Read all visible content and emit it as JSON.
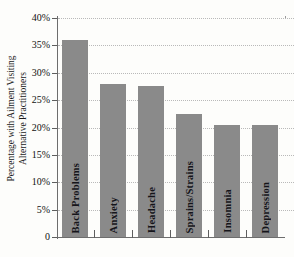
{
  "chart_data": {
    "type": "bar",
    "title_visible": "",
    "xlabel": "",
    "ylabel": "Percentage with Ailment Visiting Alternative Practitioners",
    "ylabel_lines": [
      "Percentage with Ailment Visiting",
      "Alternative Practitioners"
    ],
    "categories": [
      "Back Problems",
      "Anxiety",
      "Headache",
      "Sprains/Strains",
      "Insomnia",
      "Depression"
    ],
    "values": [
      36,
      28,
      27.5,
      22.5,
      20.5,
      20.5
    ],
    "ylim": [
      0,
      40
    ],
    "ytick_values": [
      0,
      5,
      10,
      15,
      20,
      25,
      30,
      35,
      40
    ],
    "ytick_labels": [
      "0",
      "5%",
      "10%",
      "15%",
      "20%",
      "25%",
      "30%",
      "35%",
      "40%"
    ],
    "grid": "horizontal-dotted",
    "legend": "none",
    "bar_color": "#8a8a8a",
    "axis_color": "#6d6d6d",
    "grid_color": "#b9b9b9",
    "background_color": "#fdfdfb",
    "label_placement": "inside-bar-rotated"
  }
}
